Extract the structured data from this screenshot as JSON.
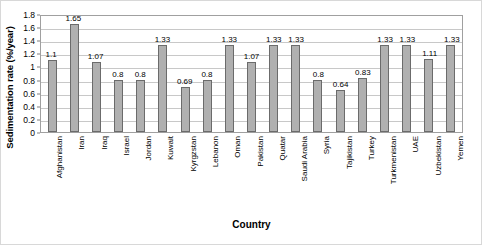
{
  "chart_data": {
    "type": "bar",
    "title": "",
    "xlabel": "Country",
    "ylabel": "Sedimentation rate (%/year)",
    "ylim": [
      0,
      1.8
    ],
    "ytick_step": 0.2,
    "ytick_labels": [
      "1.8",
      "1.6",
      "1.4",
      "1.2",
      "1",
      "0.8",
      "0.6",
      "0.4",
      "0.2",
      "0"
    ],
    "ytick_values": [
      1.8,
      1.6,
      1.4,
      1.2,
      1.0,
      0.8,
      0.6,
      0.4,
      0.2,
      0
    ],
    "grid": "horizontal",
    "legend": "none",
    "bar_color": "#b0b0b0",
    "bar_border_color": "#6b6b6b",
    "categories": [
      "Afghanistan",
      "Iran",
      "Iraq",
      "Israel",
      "Jordan",
      "Kuwait",
      "Kyrgzstan",
      "Lebanon",
      "Oman",
      "Pakistan",
      "Quatar",
      "Saudi Arabia",
      "Syria",
      "Tajikistan",
      "Turkey",
      "Turkmenistan",
      "UAE",
      "Uzbekistan",
      "Yemen"
    ],
    "values": [
      1.1,
      1.65,
      1.07,
      0.8,
      0.8,
      1.33,
      0.69,
      0.8,
      1.33,
      1.07,
      1.33,
      1.33,
      0.8,
      0.64,
      0.83,
      1.33,
      1.33,
      1.11,
      1.33
    ],
    "value_labels": [
      "1.1",
      "1.65",
      "1.07",
      "0.8",
      "0.8",
      "1.33",
      "0.69",
      "0.8",
      "1.33",
      "1.07",
      "1.33",
      "1.33",
      "0.8",
      "0.64",
      "0.83",
      "1.33",
      "1.33",
      "1.11",
      "1.33"
    ]
  }
}
